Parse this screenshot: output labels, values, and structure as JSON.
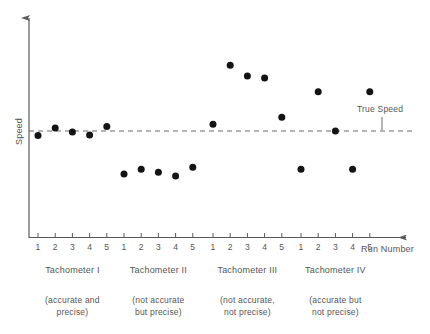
{
  "chart_data": {
    "type": "scatter",
    "title": "",
    "xlabel": "Run Number",
    "ylabel": "Speed",
    "reference_line": {
      "label": "True Speed",
      "value": 0,
      "style": "dashed"
    },
    "x_tick_labels": [
      "1",
      "2",
      "3",
      "4",
      "5"
    ],
    "y_axis_ticks_shown": false,
    "grid": false,
    "legend": "none",
    "groups": [
      {
        "name": "Tachometer I",
        "numeral": "I",
        "description_line1": "(accurate and",
        "description_line2": "precise)",
        "runs": [
          1,
          2,
          3,
          4,
          5
        ],
        "values": [
          -0.9,
          0.6,
          -0.2,
          -0.8,
          0.9
        ]
      },
      {
        "name": "Tachometer II",
        "numeral": "II",
        "description_line1": "(not accurate",
        "description_line2": "but precise)",
        "runs": [
          1,
          2,
          3,
          4,
          5
        ],
        "values": [
          -8.8,
          -7.8,
          -8.4,
          -9.2,
          -7.4
        ]
      },
      {
        "name": "Tachometer III",
        "numeral": "III",
        "description_line1": "(not accurate,",
        "description_line2": "not precise)",
        "runs": [
          1,
          2,
          3,
          4,
          5
        ],
        "values": [
          1.4,
          13.4,
          11.2,
          10.8,
          2.8
        ]
      },
      {
        "name": "Tachometer IV",
        "numeral": "IV",
        "description_line1": "(accurate but",
        "description_line2": "not precise)",
        "runs": [
          1,
          2,
          3,
          4,
          5
        ],
        "values": [
          -7.8,
          8.0,
          0.0,
          -7.8,
          8.0
        ]
      }
    ],
    "colors": {
      "point": "#141414",
      "axis": "#5a5a5a",
      "reference_line": "#6b6b6b",
      "text": "#555555",
      "background": "#ffffff"
    }
  }
}
